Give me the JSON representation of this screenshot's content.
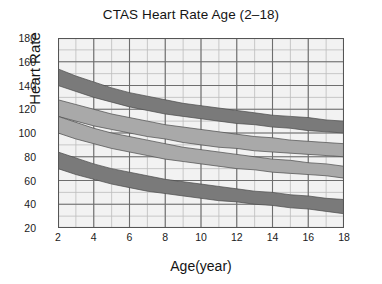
{
  "chart_data": {
    "type": "area",
    "title": "CTAS Heart Rate Age (2–18)",
    "xlabel": "Age(year)",
    "ylabel": "Heart Rate",
    "xlim": [
      2,
      18
    ],
    "ylim": [
      20,
      180
    ],
    "x_ticks": [
      2,
      4,
      6,
      8,
      10,
      12,
      14,
      16,
      18
    ],
    "y_ticks": [
      20,
      40,
      60,
      80,
      100,
      120,
      140,
      160,
      180
    ],
    "grid": {
      "x_major_step": 2,
      "x_minor_step": 1,
      "y_major_step": 20,
      "y_minor_step": 10,
      "background": "#f2f2f2",
      "major_color": "#6e6e6e",
      "minor_color": "#bdbdbd"
    },
    "legend": null,
    "x": [
      2,
      3,
      4,
      5,
      6,
      7,
      8,
      9,
      10,
      11,
      12,
      13,
      14,
      15,
      16,
      17,
      18
    ],
    "bands": [
      {
        "name": "band-1-upper-dark",
        "color": "#7a7a7a",
        "upper": [
          154,
          148,
          143,
          138,
          134,
          131,
          128,
          125,
          123,
          121,
          119,
          117,
          115,
          114,
          113,
          111,
          110
        ],
        "lower": [
          140,
          135,
          130,
          126,
          122,
          119,
          116,
          114,
          112,
          110,
          108,
          107,
          105,
          104,
          102,
          101,
          100
        ]
      },
      {
        "name": "band-2-upper-light",
        "color": "#a9a9a9",
        "upper": [
          128,
          124,
          120,
          116,
          113,
          110,
          107,
          105,
          103,
          101,
          99,
          97,
          96,
          94,
          93,
          92,
          91
        ],
        "lower": [
          114,
          110,
          106,
          103,
          100,
          97,
          95,
          92,
          90,
          88,
          87,
          85,
          84,
          83,
          82,
          81,
          80
        ]
      },
      {
        "name": "band-3-middle-light",
        "color": "#a9a9a9",
        "upper": [
          114,
          109,
          104,
          100,
          97,
          94,
          91,
          88,
          86,
          84,
          82,
          80,
          78,
          77,
          75,
          74,
          72
        ],
        "lower": [
          100,
          95,
          91,
          87,
          84,
          81,
          78,
          76,
          74,
          72,
          70,
          69,
          67,
          66,
          65,
          64,
          62
        ]
      },
      {
        "name": "band-4-lower-dark",
        "color": "#7a7a7a",
        "upper": [
          84,
          79,
          74,
          70,
          67,
          64,
          61,
          59,
          57,
          55,
          53,
          51,
          50,
          48,
          47,
          45,
          44
        ],
        "lower": [
          70,
          65,
          61,
          57,
          54,
          51,
          49,
          47,
          45,
          43,
          42,
          40,
          39,
          37,
          36,
          34,
          32
        ]
      }
    ]
  }
}
